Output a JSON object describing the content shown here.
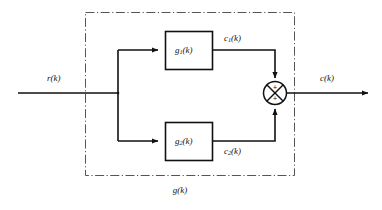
{
  "diagram": {
    "type": "block-diagram",
    "title": "",
    "outer_block_label": "g(k)",
    "input": {
      "label": "r(k)",
      "name": "input-signal"
    },
    "output": {
      "label": "c(k)",
      "name": "output-signal"
    },
    "blocks": [
      {
        "id": "g1",
        "label_base": "g",
        "label_sub": "1",
        "label_arg": "(k)",
        "label_full": "g1(k)",
        "output_signal_base": "c",
        "output_signal_sub": "1",
        "output_signal_arg": "(k)",
        "output_signal_full": "c1(k)"
      },
      {
        "id": "g2",
        "label_base": "g",
        "label_sub": "2",
        "label_arg": "(k)",
        "label_full": "g2(k)",
        "output_signal_base": "c",
        "output_signal_sub": "2",
        "output_signal_arg": "(k)",
        "output_signal_full": "c2(k)"
      }
    ],
    "summing_junction": {
      "name": "summing-junction",
      "sign_top": "+",
      "sign_bottom": "+"
    },
    "colors": {
      "line": "#111111",
      "border_dashdot": "#555555",
      "background": "#ffffff",
      "text": "#111111"
    }
  }
}
